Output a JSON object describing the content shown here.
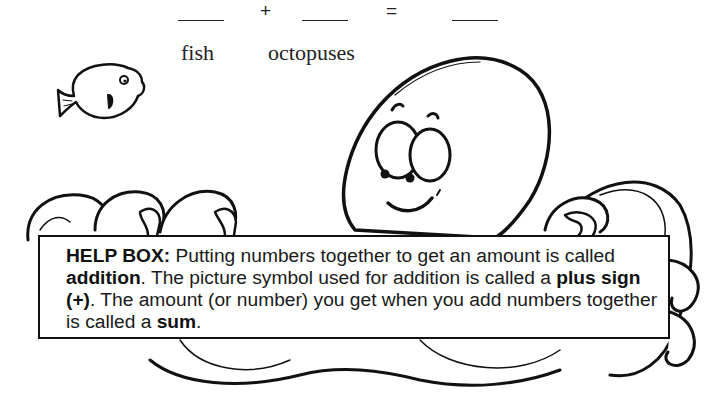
{
  "equation": {
    "blank_1": "____",
    "plus": "+",
    "blank_2": "____",
    "equals": "=",
    "blank_3": "____"
  },
  "labels": {
    "fish": "fish",
    "octopuses": "octopuses"
  },
  "help_box": {
    "title": "HELP BOX:",
    "segments": [
      {
        "text": "Putting numbers together to get an amount is called ",
        "bold": false
      },
      {
        "text": "addition",
        "bold": true
      },
      {
        "text": ". The picture symbol used for addition is called a ",
        "bold": false
      },
      {
        "text": "plus sign (+)",
        "bold": true
      },
      {
        "text": ". The amount (or number) you get when you add numbers together is called a ",
        "bold": false
      },
      {
        "text": "sum",
        "bold": true
      },
      {
        "text": ".",
        "bold": false
      }
    ]
  },
  "illustrations": {
    "fish": "fish-icon",
    "octopus": "octopus-icon"
  },
  "colors": {
    "ink": "#111111",
    "paper": "#ffffff"
  }
}
